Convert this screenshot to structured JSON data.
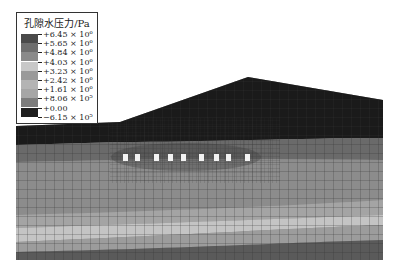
{
  "legend": {
    "title": "孔隙水压力/Pa",
    "labels": [
      "+6.45 × 10⁶",
      "+5.65 × 10⁶",
      "+4.84 × 10⁶",
      "+4.03 × 10⁶",
      "+3.23 × 10⁶",
      "+2.42 × 10⁶",
      "+1.61 × 10⁶",
      "+8.06 × 10⁵",
      "+0.00",
      "−6.15 × 10⁵"
    ],
    "colors": [
      "#4a4a4a",
      "#6e6e6e",
      "#8a8a8a",
      "#c8c8c8",
      "#9a9a9a",
      "#b4b4b4",
      "#a6a6a6",
      "#7c7c7c",
      "#1e1e1e",
      "#0a0a0a"
    ]
  },
  "model": {
    "tunnel_count": 9,
    "layer_colors": [
      "#1a1a1a",
      "#6a6a6a",
      "#8c8c8c",
      "#a0a0a0",
      "#c4c4c4",
      "#9c9c9c",
      "#5a5a5a"
    ]
  }
}
